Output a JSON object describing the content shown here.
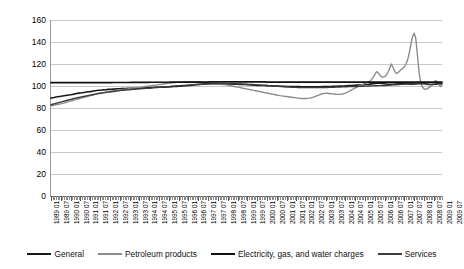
{
  "chart_data": {
    "type": "line",
    "title": "",
    "xlabel": "",
    "ylabel": "",
    "ylim": [
      0,
      160
    ],
    "yticks": [
      0,
      20,
      40,
      60,
      80,
      100,
      120,
      140,
      160
    ],
    "grid": true,
    "legend_position": "bottom",
    "x_tick_labels": [
      "1989 01",
      "1989 07",
      "1990 01",
      "1990 07",
      "1991 01",
      "1991 07",
      "1992 01",
      "1992 07",
      "1993 01",
      "1993 07",
      "1994 01",
      "1994 07",
      "1995 01",
      "1995 07",
      "1996 01",
      "1996 07",
      "1997 01",
      "1997 07",
      "1998 01",
      "1998 07",
      "1999 01",
      "1999 07",
      "2000 01",
      "2000 07",
      "2001 01",
      "2001 07",
      "2002 01",
      "2002 07",
      "2003 01",
      "2003 07",
      "2004 01",
      "2004 07",
      "2005 01",
      "2005 07",
      "2006 01",
      "2006 07",
      "2007 01",
      "2007 07",
      "2008 01",
      "2008 07",
      "2009 01",
      "2009 07"
    ],
    "x_start": "1989 01",
    "x_end": "2009 07",
    "series": [
      {
        "name": "General",
        "color": "#1a1a1a",
        "width": 1.6,
        "values": [
          89.0,
          89.3,
          89.6,
          90.0,
          90.2,
          90.4,
          90.6,
          90.9,
          91.2,
          91.4,
          91.6,
          91.8,
          92.0,
          92.3,
          92.6,
          93.0,
          93.3,
          93.5,
          93.7,
          93.9,
          94.1,
          94.3,
          94.5,
          94.7,
          94.9,
          95.1,
          95.4,
          95.7,
          95.9,
          96.1,
          96.2,
          96.3,
          96.5,
          96.6,
          96.7,
          96.9,
          97.0,
          97.1,
          97.2,
          97.3,
          97.4,
          97.5,
          97.5,
          97.6,
          97.6,
          97.7,
          97.7,
          97.8,
          97.8,
          97.9,
          97.9,
          98.0,
          98.0,
          98.0,
          98.1,
          98.1,
          98.2,
          98.2,
          98.3,
          98.3,
          98.4,
          98.5,
          98.6,
          98.7,
          98.8,
          98.8,
          98.9,
          98.9,
          99.0,
          99.0,
          99.1,
          99.1,
          99.2,
          99.3,
          99.4,
          99.5,
          99.6,
          99.7,
          99.8,
          99.9,
          100.0,
          100.1,
          100.2,
          100.3,
          100.4,
          100.6,
          100.8,
          101.0,
          101.2,
          101.3,
          101.4,
          101.5,
          101.6,
          101.7,
          101.8,
          101.9,
          102.0,
          102.1,
          102.1,
          102.2,
          102.2,
          102.2,
          102.2,
          102.1,
          102.1,
          102.0,
          102.0,
          101.9,
          101.9,
          101.8,
          101.8,
          101.7,
          101.7,
          101.6,
          101.6,
          101.5,
          101.5,
          101.4,
          101.4,
          101.3,
          101.2,
          101.1,
          101.0,
          100.9,
          100.8,
          100.7,
          100.6,
          100.6,
          100.5,
          100.5,
          100.4,
          100.4,
          100.3,
          100.2,
          100.2,
          100.1,
          100.0,
          100.0,
          99.9,
          99.9,
          99.8,
          99.8,
          99.7,
          99.7,
          99.6,
          99.6,
          99.6,
          99.5,
          99.5,
          99.5,
          99.4,
          99.4,
          99.4,
          99.3,
          99.3,
          99.3,
          99.2,
          99.2,
          99.2,
          99.2,
          99.2,
          99.2,
          99.2,
          99.3,
          99.3,
          99.3,
          99.4,
          99.4,
          99.5,
          99.5,
          99.6,
          99.6,
          99.7,
          99.7,
          99.8,
          99.8,
          99.9,
          99.9,
          100.0,
          100.0,
          100.1,
          100.2,
          100.3,
          100.4,
          100.5,
          100.6,
          100.7,
          100.8,
          100.9,
          101.0,
          101.1,
          101.2,
          101.3,
          101.4,
          101.5,
          101.7,
          101.9,
          102.1,
          102.3,
          102.5,
          102.6,
          102.6,
          102.5,
          102.3,
          102.0,
          101.8,
          101.6,
          101.5,
          101.5,
          101.6,
          101.7,
          101.8,
          101.9,
          102.0,
          102.1,
          102.2,
          102.1,
          102.0,
          101.9,
          101.8,
          101.7,
          101.7,
          101.8,
          101.9,
          102.0,
          102.2,
          102.4,
          102.5,
          102.3,
          102.0,
          101.7,
          101.5,
          101.4,
          101.4,
          101.5,
          101.6,
          101.7,
          101.8,
          101.9,
          102.0
        ]
      },
      {
        "name": "Petroleum products",
        "color": "#8c8c8c",
        "width": 1.4,
        "values": [
          82.0,
          82.3,
          82.6,
          82.9,
          83.2,
          83.5,
          83.8,
          84.2,
          84.6,
          85.0,
          85.5,
          86.0,
          86.4,
          86.8,
          87.2,
          87.6,
          88.0,
          88.4,
          88.8,
          89.2,
          89.6,
          90.0,
          90.4,
          90.8,
          91.2,
          91.6,
          92.0,
          92.4,
          92.8,
          93.1,
          93.4,
          93.7,
          94.0,
          94.3,
          94.6,
          94.9,
          95.2,
          95.4,
          95.6,
          95.8,
          96.0,
          96.2,
          96.4,
          96.6,
          96.8,
          97.0,
          97.2,
          97.4,
          97.6,
          97.8,
          98.0,
          98.2,
          98.4,
          98.6,
          98.8,
          99.0,
          99.2,
          99.4,
          99.6,
          99.8,
          100.0,
          100.2,
          100.4,
          100.6,
          100.8,
          101.0,
          101.2,
          101.4,
          101.6,
          101.8,
          102.0,
          102.2,
          102.4,
          102.6,
          102.8,
          103.0,
          103.2,
          103.3,
          103.4,
          103.5,
          103.6,
          103.7,
          103.8,
          103.9,
          104.0,
          104.0,
          104.0,
          104.0,
          104.0,
          103.9,
          103.8,
          103.7,
          103.6,
          103.5,
          103.4,
          103.3,
          103.2,
          103.0,
          102.8,
          102.6,
          102.4,
          102.2,
          102.0,
          101.8,
          101.6,
          101.4,
          101.2,
          101.0,
          100.8,
          100.5,
          100.2,
          99.9,
          99.6,
          99.3,
          99.0,
          98.7,
          98.4,
          98.1,
          97.8,
          97.5,
          97.2,
          96.9,
          96.6,
          96.3,
          96.0,
          95.7,
          95.4,
          95.1,
          94.8,
          94.5,
          94.2,
          93.9,
          93.6,
          93.3,
          93.0,
          92.7,
          92.4,
          92.1,
          91.8,
          91.5,
          91.2,
          91.0,
          90.8,
          90.6,
          90.4,
          90.2,
          90.0,
          89.8,
          89.6,
          89.4,
          89.2,
          89.0,
          88.8,
          88.7,
          88.6,
          88.6,
          88.6,
          88.8,
          89.0,
          89.3,
          89.7,
          90.2,
          90.8,
          91.4,
          92.0,
          92.5,
          93.0,
          93.3,
          93.5,
          93.4,
          93.2,
          93.0,
          92.8,
          92.6,
          92.5,
          92.4,
          92.4,
          92.5,
          92.7,
          93.0,
          93.5,
          94.2,
          95.0,
          95.8,
          96.6,
          97.4,
          98.2,
          99.0,
          99.8,
          100.5,
          101.2,
          101.8,
          102.4,
          103.0,
          103.6,
          104.5,
          106.0,
          108.0,
          110.5,
          113.0,
          112.0,
          110.0,
          108.5,
          108.0,
          108.5,
          110.0,
          112.5,
          116.0,
          120.0,
          117.0,
          113.5,
          111.5,
          112.0,
          113.5,
          115.0,
          116.0,
          117.5,
          120.0,
          124.0,
          130.0,
          138.0,
          145.0,
          148.0,
          143.0,
          128.0,
          112.0,
          103.0,
          99.0,
          97.5,
          97.0,
          97.5,
          98.5,
          99.5,
          101.0,
          103.0,
          105.0,
          104.0,
          101.5,
          99.5,
          100.5
        ]
      },
      {
        "name": "Electricity, gas, and water charges",
        "color": "#111111",
        "width": 1.7,
        "values": [
          103.0,
          103.0,
          103.0,
          103.0,
          103.0,
          103.0,
          103.0,
          103.0,
          103.0,
          103.0,
          103.0,
          103.0,
          103.0,
          103.0,
          103.0,
          103.0,
          103.0,
          103.0,
          103.0,
          103.0,
          103.0,
          103.0,
          103.0,
          103.0,
          103.0,
          103.1,
          103.1,
          103.1,
          103.1,
          103.1,
          103.1,
          103.1,
          103.1,
          103.1,
          103.1,
          103.1,
          103.1,
          103.1,
          103.2,
          103.2,
          103.2,
          103.2,
          103.2,
          103.2,
          103.2,
          103.2,
          103.2,
          103.2,
          103.2,
          103.3,
          103.3,
          103.3,
          103.3,
          103.3,
          103.3,
          103.3,
          103.3,
          103.3,
          103.3,
          103.3,
          103.3,
          103.4,
          103.4,
          103.4,
          103.4,
          103.4,
          103.4,
          103.4,
          103.4,
          103.4,
          103.4,
          103.4,
          103.4,
          103.5,
          103.5,
          103.5,
          103.5,
          103.5,
          103.5,
          103.5,
          103.5,
          103.5,
          103.5,
          103.5,
          103.5,
          103.6,
          103.6,
          103.6,
          103.6,
          103.6,
          103.6,
          103.6,
          103.6,
          103.6,
          103.6,
          103.6,
          103.6,
          103.7,
          103.7,
          103.7,
          103.7,
          103.7,
          103.7,
          103.7,
          103.7,
          103.7,
          103.7,
          103.7,
          103.7,
          103.7,
          103.7,
          103.7,
          103.7,
          103.7,
          103.7,
          103.7,
          103.7,
          103.7,
          103.7,
          103.7,
          103.7,
          103.7,
          103.7,
          103.7,
          103.7,
          103.7,
          103.7,
          103.7,
          103.7,
          103.7,
          103.7,
          103.7,
          103.6,
          103.6,
          103.6,
          103.6,
          103.6,
          103.6,
          103.6,
          103.6,
          103.6,
          103.6,
          103.6,
          103.6,
          103.6,
          103.5,
          103.5,
          103.5,
          103.5,
          103.5,
          103.5,
          103.5,
          103.5,
          103.5,
          103.5,
          103.5,
          103.5,
          103.5,
          103.5,
          103.5,
          103.5,
          103.5,
          103.5,
          103.5,
          103.5,
          103.5,
          103.5,
          103.5,
          103.5,
          103.5,
          103.5,
          103.5,
          103.5,
          103.5,
          103.5,
          103.5,
          103.5,
          103.5,
          103.5,
          103.5,
          103.5,
          103.5,
          103.5,
          103.5,
          103.5,
          103.5,
          103.5,
          103.5,
          103.5,
          103.5,
          103.5,
          103.5,
          103.5,
          103.5,
          103.5,
          103.5,
          103.6,
          103.6,
          103.6,
          103.6,
          103.6,
          103.6,
          103.6,
          103.6,
          103.6,
          103.6,
          103.6,
          103.6,
          103.6,
          103.6,
          103.6,
          103.6,
          103.6,
          103.6,
          103.6,
          103.6,
          103.6,
          103.6,
          103.6,
          103.6,
          103.6,
          103.6,
          103.6,
          103.6,
          103.6,
          103.6,
          103.6,
          103.6,
          103.6,
          103.6,
          103.6,
          103.6,
          103.6,
          103.6,
          103.6,
          103.6,
          103.6,
          103.6,
          103.6,
          103.6
        ]
      },
      {
        "name": "Services",
        "color": "#3b3b3b",
        "width": 1.4,
        "values": [
          83.0,
          83.4,
          83.8,
          84.2,
          84.6,
          85.0,
          85.4,
          85.8,
          86.2,
          86.6,
          87.0,
          87.4,
          87.8,
          88.2,
          88.6,
          89.0,
          89.3,
          89.6,
          89.9,
          90.2,
          90.5,
          90.8,
          91.1,
          91.4,
          91.7,
          92.0,
          92.3,
          92.6,
          92.9,
          93.2,
          93.4,
          93.6,
          93.8,
          94.0,
          94.2,
          94.4,
          94.6,
          94.8,
          95.0,
          95.2,
          95.4,
          95.6,
          95.8,
          96.0,
          96.2,
          96.3,
          96.4,
          96.5,
          96.6,
          96.8,
          97.0,
          97.1,
          97.2,
          97.3,
          97.4,
          97.5,
          97.6,
          97.7,
          97.8,
          97.9,
          98.0,
          98.2,
          98.4,
          98.5,
          98.6,
          98.7,
          98.8,
          98.9,
          99.0,
          99.1,
          99.2,
          99.3,
          99.4,
          99.6,
          99.8,
          99.9,
          100.0,
          100.1,
          100.2,
          100.3,
          100.4,
          100.5,
          100.6,
          100.7,
          100.8,
          100.9,
          101.0,
          101.1,
          101.2,
          101.3,
          101.4,
          101.5,
          101.6,
          101.7,
          101.8,
          101.9,
          102.0,
          102.1,
          102.2,
          102.2,
          102.3,
          102.3,
          102.3,
          102.3,
          102.3,
          102.3,
          102.3,
          102.3,
          102.2,
          102.2,
          102.1,
          102.1,
          102.0,
          102.0,
          101.9,
          101.9,
          101.8,
          101.8,
          101.7,
          101.7,
          101.6,
          101.5,
          101.4,
          101.3,
          101.2,
          101.1,
          101.0,
          100.9,
          100.8,
          100.7,
          100.6,
          100.5,
          100.4,
          100.3,
          100.2,
          100.1,
          100.0,
          99.9,
          99.8,
          99.7,
          99.6,
          99.5,
          99.4,
          99.3,
          99.2,
          99.1,
          99.0,
          98.9,
          98.9,
          98.8,
          98.8,
          98.7,
          98.7,
          98.6,
          98.6,
          98.5,
          98.5,
          98.5,
          98.5,
          98.5,
          98.5,
          98.5,
          98.5,
          98.5,
          98.5,
          98.5,
          98.6,
          98.6,
          98.7,
          98.7,
          98.8,
          98.8,
          98.9,
          98.9,
          99.0,
          99.0,
          99.1,
          99.1,
          99.2,
          99.2,
          99.3,
          99.3,
          99.4,
          99.4,
          99.5,
          99.5,
          99.6,
          99.6,
          99.7,
          99.7,
          99.8,
          99.8,
          99.9,
          99.9,
          100.0,
          100.0,
          100.1,
          100.1,
          100.2,
          100.2,
          100.3,
          100.3,
          100.4,
          100.4,
          100.5,
          100.6,
          100.7,
          100.8,
          100.9,
          101.0,
          101.1,
          101.2,
          101.3,
          101.4,
          101.5,
          101.6,
          101.7,
          101.8,
          101.9,
          102.0,
          102.1,
          102.2,
          102.3,
          102.3,
          102.3,
          102.2,
          102.1,
          102.0,
          101.9,
          101.8,
          101.7,
          101.6,
          101.5,
          101.5,
          101.6,
          101.8,
          102.0,
          102.2,
          102.3,
          102.4
        ]
      }
    ]
  },
  "legend": {
    "items": [
      {
        "label": "General"
      },
      {
        "label": "Petroleum products"
      },
      {
        "label": "Electricity, gas, and water charges"
      },
      {
        "label": "Services"
      }
    ]
  }
}
